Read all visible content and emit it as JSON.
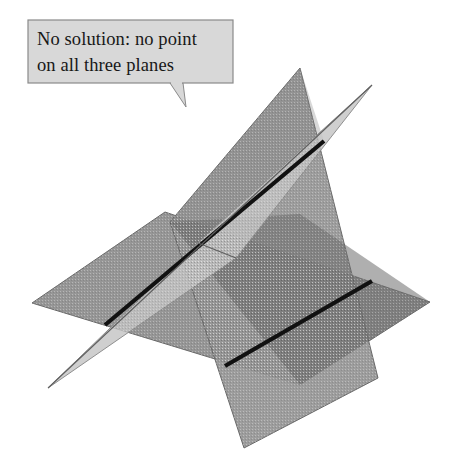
{
  "figure": {
    "background_color": "#ffffff",
    "callout": {
      "name": "no-solution-callout",
      "lines": [
        "No solution: no point",
        "on all three planes"
      ],
      "box": {
        "x": 28,
        "y": 20,
        "width": 205,
        "height": 63
      },
      "fill_color": "#d8d8d8",
      "border_color": "#8a8a8a",
      "text_color": "#171717",
      "tail": {
        "from_x": 170,
        "from_y": 83,
        "to_x": 186,
        "to_y": 107,
        "base_x": 183
      }
    },
    "planes": [
      {
        "name": "vertical-plane",
        "label": "Plane 1 (steep vertical quadrilateral)",
        "fill_color": "#969696",
        "stroke_color": "#6a6a6a",
        "points": "170,222 300,68 378,378 244,448"
      },
      {
        "name": "horizontal-plane",
        "label": "Plane 2 (wide horizontal parallelogram)",
        "fill_color": "#969696",
        "stroke_color": "#6a6a6a",
        "points": "165,212 32,303 300,385 430,302"
      },
      {
        "name": "sliver-plane",
        "label": "Plane 3 (thin edge-on sliver)",
        "fill_color": "#c4c4c4",
        "stroke_color": "#8f8f8f",
        "points": "372,85 236,258 48,388 198,243"
      }
    ],
    "intersection_lines": [
      {
        "name": "intersection-line-upper",
        "label": "Line where plane 1 meets plane 3",
        "color": "#111111",
        "width": 4.2,
        "x1": 105,
        "y1": 325,
        "x2": 324,
        "y2": 141
      },
      {
        "name": "intersection-line-lower",
        "label": "Line where plane 1 meets plane 2",
        "color": "#111111",
        "width": 4.2,
        "x1": 225,
        "y1": 366,
        "x2": 372,
        "y2": 281
      }
    ],
    "overlap_regions": [
      {
        "name": "overlap-shade-center",
        "fill_color": "#6e6e6e",
        "points": "170,222 300,385 430,302 300,214"
      },
      {
        "name": "overlap-shade-upper",
        "fill_color": "#7d7d7d",
        "points": "196,243 324,141 300,68 170,222"
      }
    ],
    "colors": {
      "plane_mid_gray": "#969696",
      "plane_dark_gray": "#6e6e6e",
      "plane_light_gray": "#c4c4c4",
      "line_black": "#111111",
      "callout_gray": "#d8d8d8"
    }
  }
}
